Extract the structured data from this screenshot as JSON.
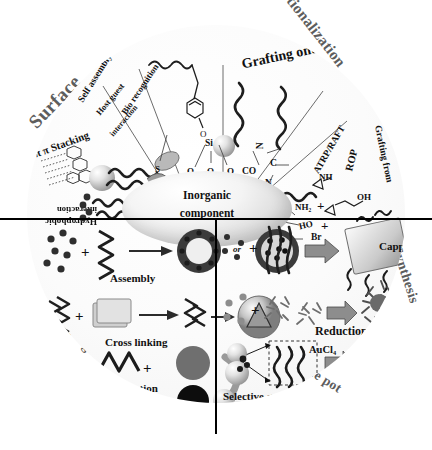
{
  "figure": {
    "center_label_line1": "Inorganic",
    "center_label_line2": "component",
    "colors": {
      "ring": "#8d8d8d",
      "ring_text": "#5d5d5d",
      "ink": "#111111",
      "divider": "#000000",
      "disc": "#fbfbfb"
    }
  },
  "outer_ring": {
    "sectors": [
      {
        "id": "surface",
        "label": "Surface"
      },
      {
        "id": "functionalization",
        "label": "Functionalization"
      },
      {
        "id": "synthesis",
        "label": "Synthesis"
      },
      {
        "id": "one-pot",
        "label": "One pot"
      },
      {
        "id": "wrapping",
        "label": "Wrapping"
      }
    ]
  },
  "quadrants": {
    "top_left": {
      "name": "Surface",
      "radial_labels": [
        {
          "id": "self-assembly",
          "label": "Self assembly"
        },
        {
          "id": "host-guest",
          "label": "Host guest",
          "label2": "interaction"
        },
        {
          "id": "bio-recognition",
          "label": "Bio recognition"
        },
        {
          "id": "pi-pi-stacking",
          "label": "π π Stacking"
        },
        {
          "id": "hydrophobic",
          "label": "Hydrophobic",
          "label2": "interaction"
        }
      ]
    },
    "top_right": {
      "name": "Functionalization",
      "radial_labels": [
        {
          "id": "grafting-onto",
          "label": "Grafting onto"
        },
        {
          "id": "atrp-raft",
          "label": "ATRP/RAFT"
        },
        {
          "id": "rop",
          "label": "ROP"
        },
        {
          "id": "grafting-from",
          "label": "Grafting from"
        }
      ],
      "chemistry": [
        {
          "id": "si",
          "label": "Si"
        },
        {
          "id": "o1",
          "label": "O"
        },
        {
          "id": "o2",
          "label": "O"
        },
        {
          "id": "o3",
          "label": "O"
        },
        {
          "id": "s",
          "label": "S"
        },
        {
          "id": "n1",
          "label": "N"
        },
        {
          "id": "co",
          "label": "CO"
        },
        {
          "id": "c",
          "label": "C"
        },
        {
          "id": "n2",
          "label": "N"
        },
        {
          "id": "nh",
          "label": "NH"
        },
        {
          "id": "nh2",
          "label": "NH₂"
        },
        {
          "id": "ho",
          "label": "HO"
        },
        {
          "id": "oh",
          "label": "OH"
        },
        {
          "id": "br",
          "label": "Br"
        },
        {
          "id": "plus1",
          "label": "+"
        },
        {
          "id": "plus2",
          "label": "+"
        }
      ]
    },
    "bottom_left": {
      "name": "Wrapping",
      "rows": [
        {
          "id": "assembly",
          "label": "Assembly",
          "connector": "or"
        },
        {
          "id": "cross-linking",
          "label": "Cross linking"
        },
        {
          "id": "precipitation",
          "label": "Precipitation"
        }
      ]
    },
    "bottom_right": {
      "name": "Synthesis / One pot",
      "rows": [
        {
          "id": "capping",
          "label": "Capping"
        },
        {
          "id": "reduction",
          "label": "Reduction"
        },
        {
          "id": "selective-growth",
          "label": "Selective growth",
          "reagent": "AuCl₄"
        }
      ]
    }
  },
  "caption": {
    "text": ""
  }
}
